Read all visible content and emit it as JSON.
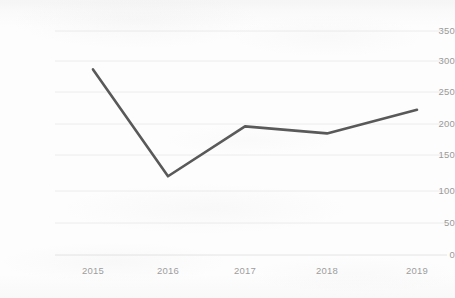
{
  "chart_data": {
    "type": "line",
    "title": "",
    "subtitle": "",
    "xlabel": "",
    "ylabel": "",
    "categories": [
      "2015",
      "2016",
      "2017",
      "2018",
      "2019"
    ],
    "values": [
      290,
      123,
      201,
      190,
      227
    ],
    "series": [
      {
        "name": "",
        "values": [
          290,
          123,
          201,
          190,
          227
        ],
        "color": "#595959"
      }
    ],
    "ylim": [
      0,
      350
    ],
    "yticks": [
      0,
      50,
      100,
      150,
      200,
      250,
      300,
      350
    ],
    "ytick_labels": [
      "0",
      "50",
      "100",
      "150",
      "200",
      "250",
      "300",
      "350"
    ],
    "xtick_labels": [
      "2015",
      "2016",
      "2017",
      "2018",
      "2019"
    ],
    "grid": true,
    "grid_axis": "y",
    "grid_color": "#eeeeee",
    "legend": false,
    "legend_position": "none",
    "markers": false,
    "annotations": []
  },
  "style": {
    "line_color": "#595959",
    "tick_label_color": "#9a9a9a",
    "background_color": "#fdfdfd"
  }
}
